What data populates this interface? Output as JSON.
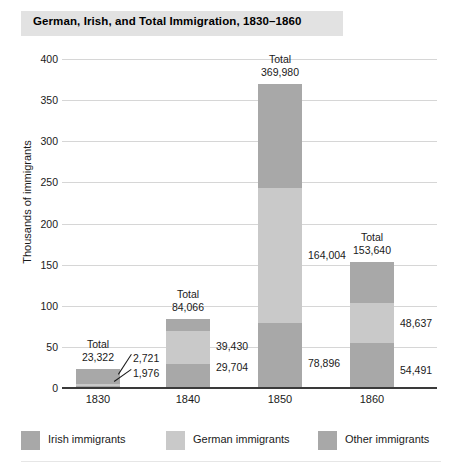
{
  "chart_data": {
    "type": "bar",
    "title": "German, Irish, and Total Immigration, 1830–1860",
    "xlabel": "",
    "ylabel": "Thousands of immigrants",
    "ylim": [
      0,
      400
    ],
    "yticks": [
      "0",
      "50",
      "100",
      "150",
      "200",
      "250",
      "300",
      "350",
      "400"
    ],
    "ytick_values": [
      0,
      50,
      100,
      150,
      200,
      250,
      300,
      350,
      400
    ],
    "grid": true,
    "stacked": true,
    "units": "thousands of immigrants",
    "legend_position": "bottom",
    "categories": [
      "1830",
      "1840",
      "1850",
      "1860"
    ],
    "series": [
      {
        "name": "Irish immigrants",
        "color": "#a8a8a8",
        "values": [
          1976,
          29704,
          78896,
          54491
        ],
        "labels": [
          "1,976",
          "29,704",
          "78,896",
          "54,491"
        ]
      },
      {
        "name": "German immigrants",
        "color": "#c9c9c9",
        "values": [
          2721,
          39430,
          164004,
          48637
        ],
        "labels": [
          "2,721",
          "39,430",
          "164,004",
          "48,637"
        ]
      },
      {
        "name": "Other immigrants",
        "color": "#a8a8a8",
        "values": [
          18625,
          14932,
          127080,
          50512
        ],
        "labels": [
          "",
          "",
          "",
          ""
        ]
      }
    ],
    "totals": [
      23322,
      84066,
      369980,
      153640
    ],
    "total_labels": [
      "23,322",
      "84,066",
      "369,980",
      "153,640"
    ],
    "total_prefix": "Total"
  },
  "title": {
    "text": "German, Irish, and Total Immigration, 1830–1860"
  },
  "axes": {
    "y_label": "Thousands of immigrants",
    "y_ticks": [
      {
        "label": "400",
        "value": 400
      },
      {
        "label": "350",
        "value": 350
      },
      {
        "label": "300",
        "value": 300
      },
      {
        "label": "250",
        "value": 250
      },
      {
        "label": "200",
        "value": 200
      },
      {
        "label": "150",
        "value": 150
      },
      {
        "label": "100",
        "value": 100
      },
      {
        "label": "50",
        "value": 50
      },
      {
        "label": "0",
        "value": 0
      }
    ],
    "x_ticks": [
      {
        "label": "1830"
      },
      {
        "label": "1840"
      },
      {
        "label": "1850"
      },
      {
        "label": "1860"
      }
    ]
  },
  "bars": [
    {
      "year": "1830",
      "total_word": "Total",
      "total_value": "23,322",
      "german_value": "2,721",
      "irish_value": "1,976"
    },
    {
      "year": "1840",
      "total_word": "Total",
      "total_value": "84,066",
      "german_value": "39,430",
      "irish_value": "29,704"
    },
    {
      "year": "1850",
      "total_word": "Total",
      "total_value": "369,980",
      "german_value": "164,004",
      "irish_value": "78,896"
    },
    {
      "year": "1860",
      "total_word": "Total",
      "total_value": "153,640",
      "german_value": "48,637",
      "irish_value": "54,491"
    }
  ],
  "legend": {
    "items": [
      {
        "label": "Irish immigrants",
        "color": "#a8a8a8"
      },
      {
        "label": "German immigrants",
        "color": "#c9c9c9"
      },
      {
        "label": "Other immigrants",
        "color": "#a8a8a8"
      }
    ]
  },
  "colors": {
    "irish": "#a8a8a8",
    "german": "#c9c9c9",
    "other": "#a8a8a8",
    "grid": "#d6d6d6",
    "axis": "#3a3a3a",
    "title_band": "#e2e2e2"
  }
}
